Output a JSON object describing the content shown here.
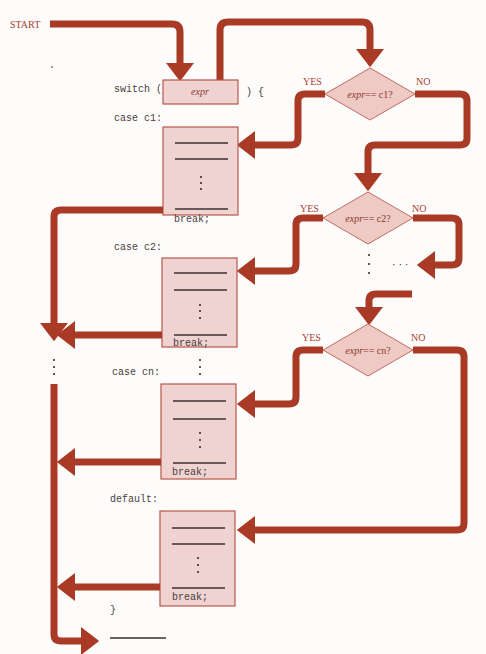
{
  "diagram": {
    "start_label": "START",
    "switch_keyword": "switch (",
    "switch_expr": "expr",
    "switch_close": ")  {",
    "cases": [
      {
        "label": "case c1:",
        "condition_prefix": "expr",
        "condition_suffix": "== c1?",
        "break_label": "break;"
      },
      {
        "label": "case c2:",
        "condition_prefix": "expr",
        "condition_suffix": "== c2?",
        "break_label": "break;"
      },
      {
        "label": "case cn:",
        "condition_prefix": "expr",
        "condition_suffix": "== cn?",
        "break_label": "break;"
      }
    ],
    "default_label": "default:",
    "default_break": "break;",
    "closing_brace": "}",
    "yes_label": "YES",
    "no_label": "NO",
    "ellipsis_horizontal": "· · ·",
    "colors": {
      "flow_arrow": "#a83a26",
      "box_fill": "#efd3d0",
      "diamond_fill": "#efc9c3",
      "label_red": "#a84030"
    }
  }
}
